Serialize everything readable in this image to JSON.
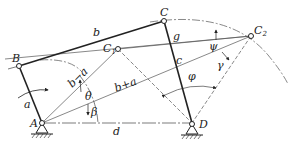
{
  "diagram": {
    "colors": {
      "line": "#222222",
      "thin": "#555555",
      "background": "#ffffff"
    },
    "points": {
      "A": {
        "label": "A",
        "x": 42,
        "y": 123
      },
      "B": {
        "label": "B",
        "x": 19,
        "y": 66
      },
      "C": {
        "label": "C",
        "x": 164,
        "y": 21
      },
      "C1": {
        "label": "C",
        "sub": "1",
        "x": 118,
        "y": 49
      },
      "C2": {
        "label": "C",
        "sub": "2",
        "x": 251,
        "y": 36
      },
      "D": {
        "label": "D",
        "x": 192,
        "y": 124
      }
    },
    "links": {
      "a": "a",
      "b": "b",
      "c": "c",
      "d": "d",
      "b_minus_a": "b−a",
      "b_plus_a": "b+a",
      "g": "g"
    },
    "angles": {
      "theta": "θ",
      "beta": "β",
      "psi": "ψ",
      "gamma": "γ",
      "phi": "φ"
    }
  }
}
